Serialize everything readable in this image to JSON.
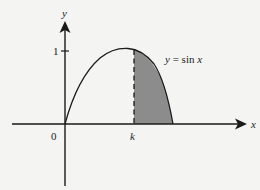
{
  "diagram": {
    "curve_label": "y = sin x",
    "curve_label_parts": {
      "y": "y",
      "eq": " = sin ",
      "x": "x"
    },
    "axes": {
      "x_label": "x",
      "y_label": "y",
      "origin_label": "0",
      "y_tick_label": "1",
      "k_label": "k"
    },
    "shaded_region": {
      "description": "area under y = sin x between x = k and x = pi",
      "fill_color": "#8c8c8c"
    },
    "colors": {
      "background": "#f4f4f2",
      "stroke": "#1a1a1a",
      "shade": "#8c8c8c"
    }
  }
}
